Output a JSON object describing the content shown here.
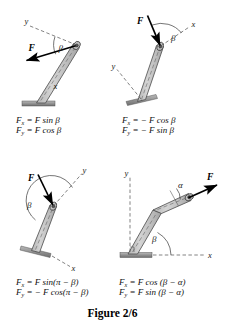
{
  "figure": {
    "caption": "Figure 2/6",
    "colors": {
      "rod_fill": "#c9c9c9",
      "rod_edge": "#4a4a4a",
      "base_fill": "#9a9a9a",
      "ink": "#000000",
      "dash": "#555555"
    }
  },
  "panels": [
    {
      "id": "panel-top-left",
      "labels": {
        "force": "F",
        "angle": "β",
        "axis_y": "y",
        "axis_x": "x"
      },
      "equations": {
        "fx": "Fₓ = F sin β",
        "fy": "Fᵧ = F cos β",
        "fx_lhs": "F",
        "fx_sub": "x",
        "fx_rhs": "= F sin β",
        "fy_lhs": "F",
        "fy_sub": "y",
        "fy_rhs": "= F cos β"
      }
    },
    {
      "id": "panel-top-right",
      "labels": {
        "force": "F",
        "angle": "β",
        "axis_y": "y",
        "axis_x": "x"
      },
      "equations": {
        "fx": "Fₓ = − F cos β",
        "fy": "Fᵧ = − F sin β",
        "fx_lhs": "F",
        "fx_sub": "x",
        "fx_rhs": "= − F cos β",
        "fy_lhs": "F",
        "fy_sub": "y",
        "fy_rhs": "= − F sin β"
      }
    },
    {
      "id": "panel-bottom-left",
      "labels": {
        "force": "F",
        "angle": "β",
        "axis_y": "y",
        "axis_x": "x"
      },
      "equations": {
        "fx": "Fₓ = F sin(π − β)",
        "fy": "Fᵧ = − F cos(π − β)",
        "fx_lhs": "F",
        "fx_sub": "x",
        "fx_rhs": "= F sin(π − β)",
        "fy_lhs": "F",
        "fy_sub": "y",
        "fy_rhs": "= − F cos(π − β)"
      }
    },
    {
      "id": "panel-bottom-right",
      "labels": {
        "force": "F",
        "angle_alpha": "α",
        "angle_beta": "β",
        "axis_y": "y",
        "axis_x": "x"
      },
      "equations": {
        "fx": "Fₓ = F cos(β − α)",
        "fy": "Fᵧ = F sin(β − α)",
        "fx_lhs": "F",
        "fx_sub": "x",
        "fx_rhs": "= F cos (β − α)",
        "fy_lhs": "F",
        "fy_sub": "y",
        "fy_rhs": "= F sin (β − α)"
      }
    }
  ]
}
